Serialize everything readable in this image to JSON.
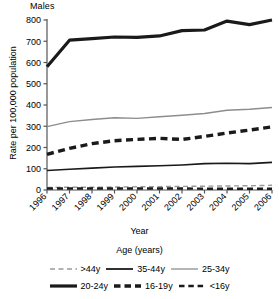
{
  "chart_data": {
    "type": "line",
    "title": "Males",
    "subtitle": "",
    "xlabel": "Year",
    "ylabel": "Rate per 100,000 population",
    "legend_title": "Age (years)",
    "legend_position": "bottom",
    "grid": false,
    "x": [
      "1996",
      "1997",
      "1998",
      "1999",
      "2000",
      "2001",
      "2002",
      "2003",
      "2004",
      "2005",
      "2006"
    ],
    "categories": [
      "1996",
      "1997",
      "1998",
      "1999",
      "2000",
      "2001",
      "2002",
      "2003",
      "2004",
      "2005",
      "2006"
    ],
    "xlim": [
      1996,
      2006
    ],
    "ylim": [
      0,
      800
    ],
    "ytick_labels": [
      "0",
      "100",
      "200",
      "300",
      "400",
      "500",
      "600",
      "700",
      "800"
    ],
    "yticks": [
      0,
      100,
      200,
      300,
      400,
      500,
      600,
      700,
      800
    ],
    "series": [
      {
        "name": ">44y",
        "values": [
          12,
          13,
          13,
          14,
          15,
          16,
          17,
          18,
          19,
          20,
          22
        ],
        "style": "dashed",
        "color": "#9a9a9a",
        "width": 1.4
      },
      {
        "name": "35-44y",
        "values": [
          92,
          98,
          103,
          108,
          111,
          114,
          118,
          124,
          126,
          124,
          130
        ],
        "style": "solid",
        "color": "#1a1a1a",
        "width": 1.6
      },
      {
        "name": "25-34y",
        "values": [
          298,
          322,
          332,
          340,
          337,
          345,
          352,
          360,
          375,
          380,
          388
        ],
        "style": "solid",
        "color": "#8d8d8d",
        "width": 1.4
      },
      {
        "name": "20-24y",
        "values": [
          580,
          705,
          712,
          720,
          718,
          725,
          750,
          753,
          795,
          778,
          800
        ],
        "style": "solid",
        "color": "#1a1a1a",
        "width": 3.2
      },
      {
        "name": "16-19y",
        "values": [
          168,
          196,
          218,
          232,
          238,
          243,
          238,
          252,
          268,
          282,
          297
        ],
        "style": "dashed",
        "color": "#1a1a1a",
        "width": 3.4
      },
      {
        "name": "<16y",
        "values": [
          7,
          7,
          7,
          7,
          7,
          7,
          7,
          6,
          6,
          6,
          6
        ],
        "style": "dashed",
        "color": "#1a1a1a",
        "width": 2.4
      }
    ],
    "legend_entries": [
      {
        "label": ">44y",
        "style": "dashed",
        "color": "#9a9a9a",
        "width": 1.4
      },
      {
        "label": "35-44y",
        "style": "solid",
        "color": "#1a1a1a",
        "width": 1.8
      },
      {
        "label": "25-34y",
        "style": "solid",
        "color": "#8d8d8d",
        "width": 1.3
      },
      {
        "label": "20-24y",
        "style": "solid",
        "color": "#1a1a1a",
        "width": 3.2
      },
      {
        "label": "16-19y",
        "style": "dashed",
        "color": "#1a1a1a",
        "width": 3.4
      },
      {
        "label": "<16y",
        "style": "dashed",
        "color": "#1a1a1a",
        "width": 2.4
      }
    ],
    "legend_rows": [
      [
        ">44y",
        "35-44y",
        "25-34y"
      ],
      [
        "20-24y",
        "16-19y",
        "<16y"
      ]
    ],
    "axis_color": "#555555"
  }
}
